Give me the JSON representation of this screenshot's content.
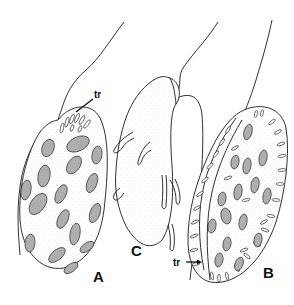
{
  "figure": {
    "panels": [
      {
        "id": "A",
        "label": "A",
        "description": "cell with trichocysts at apex, stippled body with oval plates"
      },
      {
        "id": "B",
        "label": "B",
        "description": "cell in oblique view with trichocysts along margin"
      },
      {
        "id": "C",
        "label": "C",
        "description": "cell with lobed projections, two flagella"
      }
    ],
    "annotations": [
      {
        "panel": "A",
        "text": "tr"
      },
      {
        "panel": "B",
        "text": "tr"
      }
    ],
    "colors": {
      "ink": "#1a1a1a",
      "background": "#ffffff",
      "plate_shade": "#9a9a9a"
    }
  }
}
